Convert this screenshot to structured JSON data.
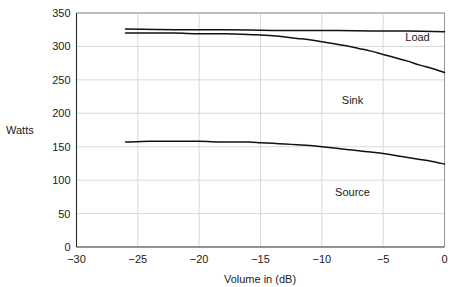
{
  "chart_data": {
    "type": "line",
    "title": "",
    "xlabel": "Volume in (dB)",
    "ylabel": "Watts",
    "xlim": [
      -30,
      0
    ],
    "ylim": [
      0,
      350
    ],
    "grid": true,
    "legend_position": "inline-annotations",
    "xticks": [
      -30,
      -25,
      -20,
      -15,
      -10,
      -5,
      0
    ],
    "xtick_labels": [
      "−30",
      "−25",
      "−20",
      "−15",
      "−10",
      "−5",
      "0"
    ],
    "yticks": [
      0,
      50,
      100,
      150,
      200,
      250,
      300,
      350
    ],
    "ytick_labels": [
      "0",
      "50",
      "100",
      "150",
      "200",
      "250",
      "300",
      "350"
    ],
    "annotations": [
      {
        "text": "Load",
        "x": -2.2,
        "y": 308
      },
      {
        "text": "Sink",
        "x": -7.5,
        "y": 214
      },
      {
        "text": "Source",
        "x": -7.5,
        "y": 77
      }
    ],
    "series": [
      {
        "name": "Load",
        "color": "#111111",
        "points": [
          {
            "x": -26.0,
            "y": 326
          },
          {
            "x": -22.0,
            "y": 325
          },
          {
            "x": -18.0,
            "y": 325
          },
          {
            "x": -14.0,
            "y": 324
          },
          {
            "x": -10.0,
            "y": 324
          },
          {
            "x": -6.0,
            "y": 323
          },
          {
            "x": -3.0,
            "y": 323
          },
          {
            "x": 0.0,
            "y": 322
          }
        ]
      },
      {
        "name": "Sink",
        "color": "#111111",
        "points": [
          {
            "x": -26.0,
            "y": 320
          },
          {
            "x": -24.0,
            "y": 320
          },
          {
            "x": -22.0,
            "y": 320
          },
          {
            "x": -20.0,
            "y": 319
          },
          {
            "x": -18.0,
            "y": 319
          },
          {
            "x": -16.0,
            "y": 318
          },
          {
            "x": -15.0,
            "y": 317
          },
          {
            "x": -14.0,
            "y": 316
          },
          {
            "x": -13.0,
            "y": 314
          },
          {
            "x": -12.0,
            "y": 312
          },
          {
            "x": -11.0,
            "y": 310
          },
          {
            "x": -10.0,
            "y": 307
          },
          {
            "x": -9.0,
            "y": 304
          },
          {
            "x": -8.0,
            "y": 301
          },
          {
            "x": -7.0,
            "y": 297
          },
          {
            "x": -6.0,
            "y": 293
          },
          {
            "x": -5.0,
            "y": 288
          },
          {
            "x": -4.0,
            "y": 283
          },
          {
            "x": -3.0,
            "y": 278
          },
          {
            "x": -2.0,
            "y": 272
          },
          {
            "x": -1.0,
            "y": 267
          },
          {
            "x": 0.0,
            "y": 261
          }
        ]
      },
      {
        "name": "Source",
        "color": "#111111",
        "points": [
          {
            "x": -26.0,
            "y": 157
          },
          {
            "x": -24.0,
            "y": 158
          },
          {
            "x": -22.0,
            "y": 158
          },
          {
            "x": -20.0,
            "y": 158
          },
          {
            "x": -18.0,
            "y": 157
          },
          {
            "x": -16.0,
            "y": 157
          },
          {
            "x": -15.0,
            "y": 156
          },
          {
            "x": -14.0,
            "y": 155
          },
          {
            "x": -13.0,
            "y": 154
          },
          {
            "x": -12.0,
            "y": 153
          },
          {
            "x": -11.0,
            "y": 152
          },
          {
            "x": -10.0,
            "y": 150
          },
          {
            "x": -9.0,
            "y": 148
          },
          {
            "x": -8.0,
            "y": 146
          },
          {
            "x": -7.0,
            "y": 144
          },
          {
            "x": -6.0,
            "y": 142
          },
          {
            "x": -5.0,
            "y": 140
          },
          {
            "x": -4.0,
            "y": 137
          },
          {
            "x": -3.0,
            "y": 134
          },
          {
            "x": -2.0,
            "y": 131
          },
          {
            "x": -1.0,
            "y": 128
          },
          {
            "x": 0.0,
            "y": 124
          }
        ]
      }
    ]
  }
}
